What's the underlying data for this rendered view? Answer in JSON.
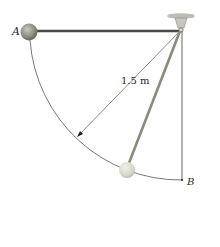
{
  "figure": {
    "type": "pendulum-diagram",
    "labels": {
      "point_a": "A",
      "point_b": "B",
      "length": "1.5 m"
    },
    "colors": {
      "rod": "#4a4a4a",
      "rod_swing": "#8a8a7e",
      "ball_start": "#8c8c84",
      "ball_end": "#d8d8cf",
      "arc": "#555555",
      "support": "#bdbdb6"
    }
  }
}
